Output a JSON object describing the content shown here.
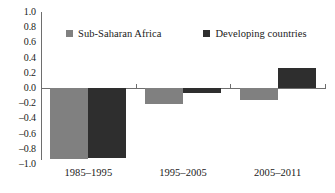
{
  "chart_data": {
    "type": "bar",
    "title": "",
    "subtitle": "",
    "xlabel": "",
    "ylabel": "",
    "categories": [
      "1985–1995",
      "1995–2005",
      "2005–2011"
    ],
    "series": [
      {
        "name": "Sub-Saharan Africa",
        "color": "#808080",
        "values": [
          -0.93,
          -0.21,
          -0.16
        ]
      },
      {
        "name": "Developing countries",
        "color": "#2e2e2e",
        "values": [
          -0.92,
          -0.06,
          0.26
        ]
      }
    ],
    "ylim": [
      -1.0,
      1.0
    ],
    "ytick_step": 0.2,
    "yticks": [
      "1.0",
      "0.8",
      "0.6",
      "0.4",
      "0.2",
      "0.0",
      "–0.2",
      "–0.4",
      "–0.6",
      "–0.8",
      "–1.0"
    ],
    "ytick_values": [
      1.0,
      0.8,
      0.6,
      0.4,
      0.2,
      0.0,
      -0.2,
      -0.4,
      -0.6,
      -0.8,
      -1.0
    ],
    "grid": false,
    "legend_position": "top",
    "zero_line": true,
    "axis_color": "#6e6e6e"
  },
  "legend": {
    "entries": [
      {
        "label": "Sub-Saharan Africa",
        "swatch_name": "legend-swatch-sub-saharan-africa"
      },
      {
        "label": "Developing countries",
        "swatch_name": "legend-swatch-developing-countries"
      }
    ]
  }
}
